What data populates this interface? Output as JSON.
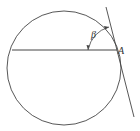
{
  "diagram": {
    "type": "geometry",
    "labels": {
      "point_a": "A",
      "angle": "β"
    },
    "colors": {
      "stroke": "#444444",
      "background": "#ffffff"
    }
  }
}
